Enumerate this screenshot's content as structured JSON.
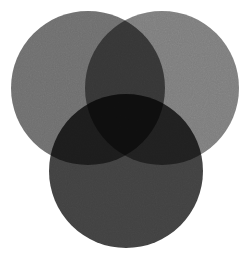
{
  "figure": {
    "name": "three-set-venn-diagram",
    "width": 251,
    "height": 260,
    "background_color": "#ffffff",
    "has_labels": false,
    "has_text": false,
    "texture": "fine paper grain / scan noise"
  },
  "chart_data": {
    "type": "venn",
    "title": "",
    "subtitle": "",
    "xlabel": "",
    "ylabel": "",
    "grid": false,
    "legend": "none",
    "set_count": 3,
    "labels_shown": false,
    "sets": [
      {
        "id": "A",
        "name": "top-left-circle",
        "cx": 88,
        "cy": 88,
        "r": 77,
        "fill": "#6e6e6e",
        "opacity": 1.0,
        "tone": "medium gray"
      },
      {
        "id": "B",
        "name": "top-right-circle",
        "cx": 162,
        "cy": 88,
        "r": 77,
        "fill": "#7d7d7d",
        "opacity": 1.0,
        "tone": "light gray"
      },
      {
        "id": "C",
        "name": "bottom-circle",
        "cx": 126,
        "cy": 171,
        "r": 77,
        "fill": "#414141",
        "opacity": 1.0,
        "tone": "dark gray"
      }
    ],
    "regions": [
      {
        "id": "A",
        "name": "only-top-left",
        "color": "#6e6e6e"
      },
      {
        "id": "B",
        "name": "only-top-right",
        "color": "#7d7d7d"
      },
      {
        "id": "C",
        "name": "only-bottom",
        "color": "#414141"
      },
      {
        "id": "AB",
        "name": "top-left-and-top-right",
        "color": "#363636"
      },
      {
        "id": "AC",
        "name": "top-left-and-bottom",
        "color": "#1d1d1d"
      },
      {
        "id": "BC",
        "name": "top-right-and-bottom",
        "color": "#212121"
      },
      {
        "id": "ABC",
        "name": "all-three-center",
        "color": "#0d0d0d"
      }
    ],
    "blend_mode": "multiply",
    "layout": {
      "arrangement": "symmetric triangular",
      "top_row_y": 88,
      "bottom_center_y": 171,
      "radius": 77,
      "leftmost_x": 11,
      "rightmost_x": 239,
      "topmost_y": 11,
      "bottommost_y": 248
    }
  }
}
